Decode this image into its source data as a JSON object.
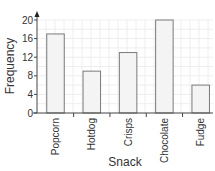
{
  "chart_data": {
    "type": "bar",
    "title": "",
    "xlabel": "Snack",
    "ylabel": "Frequency",
    "categories": [
      "Popcorn",
      "Hotdog",
      "Crisps",
      "Chocolate",
      "Fudge"
    ],
    "values": [
      17,
      9,
      13,
      20,
      6
    ],
    "ylim": [
      0,
      20
    ],
    "yticks": [
      0,
      4,
      8,
      12,
      16,
      20
    ],
    "grid": true,
    "legend": null,
    "colors": {
      "bar_fill": "#f4f4f4",
      "bar_stroke": "#7a7a7a",
      "axis": "#444444",
      "grid": "#eeeeee"
    }
  }
}
